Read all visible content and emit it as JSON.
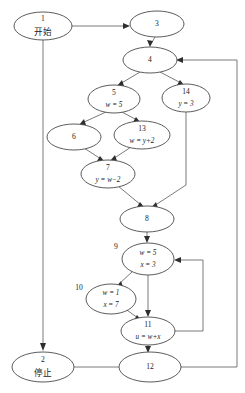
{
  "diagram": {
    "node_stroke": "#4a4a4a",
    "edge_stroke": "#6b6b6b",
    "text_color": "#1b1b1b",
    "background": "#ffffff"
  },
  "nodes": [
    {
      "id": "n1",
      "number": "1",
      "text": "开始",
      "label_position": "inside",
      "cx": 43,
      "cy": 26,
      "rx": 29,
      "ry": 14
    },
    {
      "id": "n3",
      "number": "3",
      "text": "",
      "label_position": "inside",
      "cx": 157,
      "cy": 24,
      "rx": 27,
      "ry": 13
    },
    {
      "id": "n4",
      "number": "4",
      "text": "",
      "label_position": "inside",
      "cx": 150,
      "cy": 60,
      "rx": 27,
      "ry": 13
    },
    {
      "id": "n5",
      "number": "5",
      "text": "w = 5",
      "label_position": "inside",
      "cx": 114,
      "cy": 99,
      "rx": 26,
      "ry": 14
    },
    {
      "id": "n14",
      "number": "14",
      "text": "y = 3",
      "label_position": "inside",
      "cx": 186,
      "cy": 98,
      "rx": 24,
      "ry": 14
    },
    {
      "id": "n6",
      "number": "6",
      "text": "",
      "label_position": "inside",
      "cx": 74,
      "cy": 137,
      "rx": 27,
      "ry": 13
    },
    {
      "id": "n13",
      "number": "13",
      "text": "w = y+2",
      "label_position": "inside",
      "cx": 142,
      "cy": 135,
      "rx": 28,
      "ry": 14
    },
    {
      "id": "n7",
      "number": "7",
      "text": "y = w−2",
      "label_position": "inside",
      "cx": 108,
      "cy": 174,
      "rx": 27,
      "ry": 14
    },
    {
      "id": "n8",
      "number": "8",
      "text": "",
      "label_position": "inside",
      "cx": 147,
      "cy": 219,
      "rx": 27,
      "ry": 13
    },
    {
      "id": "n9",
      "number": "9",
      "text": "w = 5",
      "text2": "x = 3",
      "label_position": "outside-left",
      "cx": 148,
      "cy": 259,
      "rx": 26,
      "ry": 16,
      "num_x": 116,
      "num_y": 247
    },
    {
      "id": "n10",
      "number": "10",
      "text": "w = 1",
      "text2": "x = 7",
      "label_position": "outside-left",
      "cx": 111,
      "cy": 299,
      "rx": 25,
      "ry": 15,
      "num_x": 79,
      "num_y": 288
    },
    {
      "id": "n11",
      "number": "11",
      "text": "u = w+x",
      "label_position": "inside",
      "cx": 148,
      "cy": 331,
      "rx": 27,
      "ry": 14
    },
    {
      "id": "n2",
      "number": "2",
      "text": "停止",
      "label_position": "inside",
      "cx": 43,
      "cy": 367,
      "rx": 31,
      "ry": 15
    },
    {
      "id": "n12",
      "number": "12",
      "text": "",
      "label_position": "inside",
      "cx": 150,
      "cy": 367,
      "rx": 31,
      "ry": 15
    }
  ],
  "edges": [
    {
      "id": "e1",
      "from": "1",
      "to": "3",
      "kind": "horizontal"
    },
    {
      "id": "e2",
      "from": "3",
      "to": "4",
      "kind": "vertical"
    },
    {
      "id": "e3",
      "from": "4",
      "to": "5",
      "kind": "branch-left"
    },
    {
      "id": "e4",
      "from": "4",
      "to": "14",
      "kind": "branch-right"
    },
    {
      "id": "e5",
      "from": "5",
      "to": "6",
      "kind": "branch-left"
    },
    {
      "id": "e6",
      "from": "5",
      "to": "13",
      "kind": "branch-right"
    },
    {
      "id": "e7",
      "from": "6",
      "to": "7",
      "kind": "merge"
    },
    {
      "id": "e8",
      "from": "13",
      "to": "7",
      "kind": "merge"
    },
    {
      "id": "e9",
      "from": "7",
      "to": "8",
      "kind": "merge"
    },
    {
      "id": "e10",
      "from": "14",
      "to": "8",
      "kind": "elbow"
    },
    {
      "id": "e11",
      "from": "8",
      "to": "9",
      "kind": "vertical"
    },
    {
      "id": "e12",
      "from": "9",
      "to": "10",
      "kind": "branch-left"
    },
    {
      "id": "e13",
      "from": "9",
      "to": "11",
      "kind": "vertical"
    },
    {
      "id": "e14",
      "from": "10",
      "to": "11",
      "kind": "merge"
    },
    {
      "id": "e15",
      "from": "11",
      "to": "12",
      "kind": "vertical"
    },
    {
      "id": "e16",
      "from": "11",
      "to": "9",
      "kind": "feedback-inner-right"
    },
    {
      "id": "e17",
      "from": "12",
      "to": "4",
      "kind": "feedback-outer-right"
    },
    {
      "id": "e18",
      "from": "1",
      "to": "2",
      "kind": "bypass-left"
    },
    {
      "id": "e19",
      "from": "2",
      "to": "12",
      "kind": "horizontal"
    }
  ]
}
